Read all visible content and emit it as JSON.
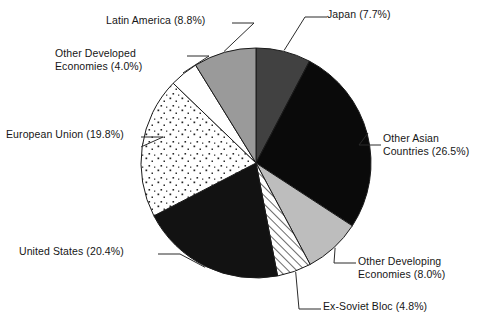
{
  "chart_data": {
    "type": "pie",
    "title": "",
    "subtitle": "",
    "xlabel": "",
    "ylabel": "",
    "legend_position": "none",
    "grid": false,
    "labels_show_percent": true,
    "start_angle_deg": 0,
    "direction": "clockwise",
    "categories": [
      "Japan",
      "Other Asian Countries",
      "Other Developing Economies",
      "Ex-Soviet Bloc",
      "United States",
      "European Union",
      "Other Developed Economies",
      "Latin America"
    ],
    "values": [
      7.7,
      26.5,
      8.0,
      4.8,
      20.4,
      19.8,
      4.0,
      8.8
    ],
    "units": "percent",
    "slices": [
      {
        "key": "japan",
        "label": "Japan (7.7%)",
        "label_lines": [
          "Japan (7.7%)"
        ],
        "name": "Japan",
        "value": 7.7,
        "fill": "#414141",
        "pattern": "solid",
        "start_deg": 0.0,
        "end_deg": 27.72
      },
      {
        "key": "other-asian-countries",
        "label": "Other Asian Countries (26.5%)",
        "label_lines": [
          "Other Asian",
          "Countries (26.5%)"
        ],
        "name": "Other Asian Countries",
        "value": 26.5,
        "fill": "#0a0a0a",
        "pattern": "solid",
        "start_deg": 27.72,
        "end_deg": 123.12
      },
      {
        "key": "other-developing-economies",
        "label": "Other Developing Economies (8.0%)",
        "label_lines": [
          "Other Developing",
          "Economies (8.0%)"
        ],
        "name": "Other Developing Economies",
        "value": 8.0,
        "fill": "#bdbdbd",
        "pattern": "solid",
        "start_deg": 123.12,
        "end_deg": 151.92
      },
      {
        "key": "ex-soviet-bloc",
        "label": "Ex-Soviet Bloc (4.8%)",
        "label_lines": [
          "Ex-Soviet Bloc (4.8%)"
        ],
        "name": "Ex-Soviet Bloc",
        "value": 4.8,
        "fill": "#ffffff",
        "pattern": "diagonal-hatch",
        "start_deg": 151.92,
        "end_deg": 169.2
      },
      {
        "key": "united-states",
        "label": "United States (20.4%)",
        "label_lines": [
          "United States (20.4%)"
        ],
        "name": "United States",
        "value": 20.4,
        "fill": "#121212",
        "pattern": "solid",
        "start_deg": 169.2,
        "end_deg": 242.64
      },
      {
        "key": "european-union",
        "label": "European Union (19.8%)",
        "label_lines": [
          "European Union (19.8%)"
        ],
        "name": "European Union",
        "value": 19.8,
        "fill": "#ffffff",
        "pattern": "dots",
        "start_deg": 242.64,
        "end_deg": 313.92
      },
      {
        "key": "other-developed-economies",
        "label": "Other Developed Economies (4.0%)",
        "label_lines": [
          "Other Developed",
          "Economies (4.0%)"
        ],
        "name": "Other Developed Economies",
        "value": 4.0,
        "fill": "#ffffff",
        "pattern": "solid",
        "start_deg": 313.92,
        "end_deg": 328.32
      },
      {
        "key": "latin-america",
        "label": "Latin America (8.8%)",
        "label_lines": [
          "Latin America (8.8%)"
        ],
        "name": "Latin America",
        "value": 8.8,
        "fill": "#9a9a9a",
        "pattern": "solid",
        "start_deg": 328.32,
        "end_deg": 360.0
      }
    ],
    "colors": {
      "outline": "#1a1a1a",
      "leader_line": "#2b2b2b",
      "background": "#ffffff",
      "text": "#161616"
    }
  }
}
